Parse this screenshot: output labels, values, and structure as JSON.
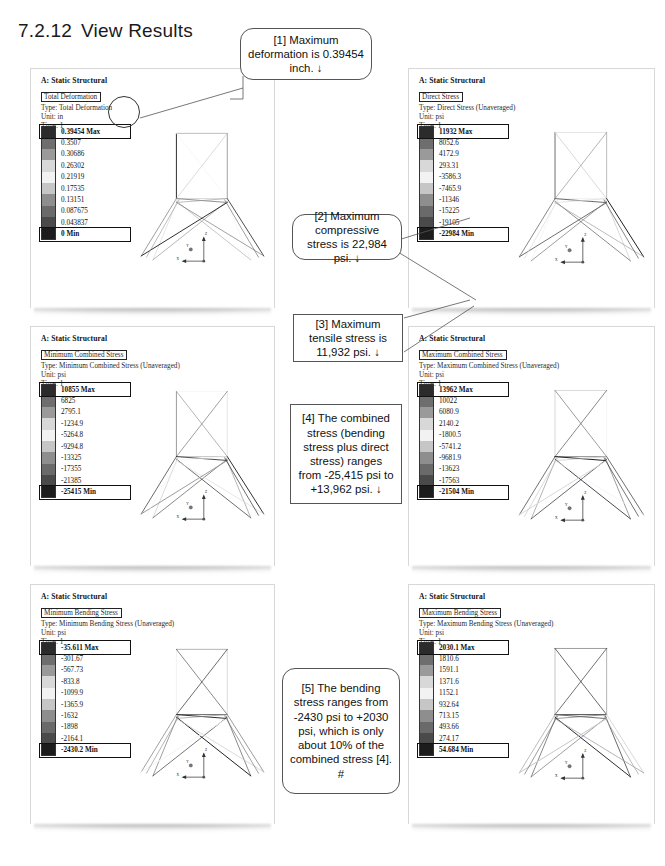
{
  "document": {
    "section_number": "7.2.12",
    "section_title": "View Results"
  },
  "panels": [
    {
      "id": "total-deformation",
      "header": {
        "title": "A: Static Structural",
        "boxed_label": "Total Deformation",
        "type_line": "Type: Total Deformation",
        "unit_line": "Unit: in",
        "time_line": "Time: 1"
      },
      "legend": {
        "max_label": "0.39454 Max",
        "values": [
          "0.3507",
          "0.30686",
          "0.26302",
          "0.21919",
          "0.17535",
          "0.13151",
          "0.087675",
          "0.043837"
        ],
        "min_label": "0 Min"
      },
      "axes": {
        "z": "Z",
        "x": "X",
        "y": "Y"
      }
    },
    {
      "id": "direct-stress",
      "header": {
        "title": "A: Static Structural",
        "boxed_label": "Direct Stress",
        "type_line": "Type: Direct Stress (Unaveraged)",
        "unit_line": "Unit: psi",
        "time_line": "Time: 1"
      },
      "legend": {
        "max_label": "11932 Max",
        "values": [
          "8052.6",
          "4172.9",
          "293.31",
          "-3586.3",
          "-7465.9",
          "-11346",
          "-15225",
          "-19105"
        ],
        "min_label": "-22984 Min"
      },
      "axes": {
        "z": "Z",
        "x": "X",
        "y": "Y"
      }
    },
    {
      "id": "minimum-combined-stress",
      "header": {
        "title": "A: Static Structural",
        "boxed_label": "Minimum Combined Stress",
        "type_line": "Type: Minimum Combined Stress (Unaveraged)",
        "unit_line": "Unit: psi",
        "time_line": "Time: 1"
      },
      "legend": {
        "max_label": "10855 Max",
        "values": [
          "6825",
          "2795.1",
          "-1234.9",
          "-5264.8",
          "-9294.8",
          "-13325",
          "-17355",
          "-21385"
        ],
        "min_label": "-25415 Min"
      },
      "axes": {
        "z": "Z",
        "x": "X",
        "y": "Y"
      }
    },
    {
      "id": "maximum-combined-stress",
      "header": {
        "title": "A: Static Structural",
        "boxed_label": "Maximum Combined Stress",
        "type_line": "Type: Maximum Combined Stress (Unaveraged)",
        "unit_line": "Unit: psi",
        "time_line": "Time: 1"
      },
      "legend": {
        "max_label": "13962 Max",
        "values": [
          "10022",
          "6080.9",
          "2140.2",
          "-1800.5",
          "-5741.2",
          "-9681.9",
          "-13623",
          "-17563"
        ],
        "min_label": "-21504 Min"
      },
      "axes": {
        "z": "Z",
        "x": "X",
        "y": "Y"
      }
    },
    {
      "id": "minimum-bending-stress",
      "header": {
        "title": "A: Static Structural",
        "boxed_label": "Minimum Bending Stress",
        "type_line": "Type: Minimum Bending Stress (Unaveraged)",
        "unit_line": "Unit: psi",
        "time_line": "Time: 1"
      },
      "legend": {
        "max_label": "-35.611 Max",
        "values": [
          "-301.67",
          "-567.73",
          "-833.8",
          "-1099.9",
          "-1365.9",
          "-1632",
          "-1898",
          "-2164.1"
        ],
        "min_label": "-2430.2 Min"
      },
      "axes": {
        "z": "Z",
        "x": "X",
        "y": "Y"
      }
    },
    {
      "id": "maximum-bending-stress",
      "header": {
        "title": "A: Static Structural",
        "boxed_label": "Maximum Bending Stress",
        "type_line": "Type: Maximum Bending Stress (Unaveraged)",
        "unit_line": "Unit: psi",
        "time_line": "Time: 1"
      },
      "legend": {
        "max_label": "2030.1 Max",
        "values": [
          "1810.6",
          "1591.1",
          "1371.6",
          "1152.1",
          "932.64",
          "713.15",
          "493.66",
          "274.17"
        ],
        "min_label": "54.684 Min"
      },
      "axes": {
        "z": "Z",
        "x": "X",
        "y": "Y"
      }
    }
  ],
  "callouts": [
    {
      "id": "callout-1",
      "text": "[1] Maximum deformation is 0.39454 inch. ↓"
    },
    {
      "id": "callout-2",
      "text": "[2] Maximum compressive stress is 22,984 psi. ↓"
    },
    {
      "id": "callout-3",
      "text": "[3] Maximum tensile stress is 11,932 psi. ↓"
    },
    {
      "id": "callout-4",
      "text": "[4] The combined stress (bending stress plus direct stress) ranges from -25,415 psi to +13,962 psi. ↓"
    },
    {
      "id": "callout-5",
      "text": "[5] The bending stress ranges from -2430 psi to +2030 psi, which is only about 10% of the combined stress [4]. #"
    }
  ],
  "colors": {
    "legend_scale": [
      "#2b2b2b",
      "#6e6e6e",
      "#9a9a9a",
      "#d8d8d8",
      "#f2f2f2",
      "#c6c6c6",
      "#8e8e8e",
      "#6a6a6a",
      "#4a4a4a",
      "#1c1c1c"
    ],
    "panel_border": "#d8d8d8",
    "text": "#111111"
  }
}
